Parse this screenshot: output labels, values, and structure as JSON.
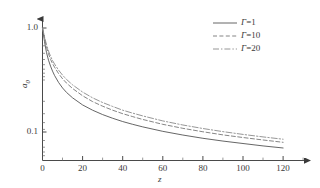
{
  "chart_data": {
    "type": "line",
    "title": "",
    "xlabel": "z",
    "ylabel": "a0",
    "ylabel_base": "a",
    "ylabel_sub": "0",
    "xlim": [
      0,
      125
    ],
    "ylim": [
      0.055,
      1.25
    ],
    "yscale": "log",
    "xscale": "linear",
    "grid": false,
    "legend_position": "top-right",
    "xticks": [
      0,
      20,
      40,
      60,
      80,
      100,
      120
    ],
    "xtick_labels": [
      "0",
      "20",
      "40",
      "60",
      "80",
      "100",
      "120"
    ],
    "yticks": [
      1.0,
      0.1
    ],
    "ytick_labels": [
      "1.0",
      "0.1"
    ],
    "x": [
      0,
      1,
      2,
      3,
      4,
      5,
      6,
      8,
      10,
      12,
      15,
      20,
      25,
      30,
      35,
      40,
      45,
      50,
      60,
      70,
      80,
      90,
      100,
      110,
      120
    ],
    "series": [
      {
        "name": "Γ=1",
        "label_symbol": "Γ",
        "label_value": "1",
        "style": "solid",
        "color": "#555555",
        "values": [
          1.0,
          0.74,
          0.58,
          0.49,
          0.43,
          0.385,
          0.35,
          0.3,
          0.265,
          0.24,
          0.213,
          0.182,
          0.162,
          0.147,
          0.1355,
          0.126,
          0.1185,
          0.112,
          0.1015,
          0.0935,
          0.087,
          0.0818,
          0.0775,
          0.0735,
          0.0702
        ]
      },
      {
        "name": "Γ=10",
        "label_symbol": "Γ",
        "label_value": "10",
        "style": "dashed",
        "color": "#777777",
        "values": [
          1.0,
          0.8,
          0.655,
          0.565,
          0.5,
          0.455,
          0.42,
          0.365,
          0.325,
          0.295,
          0.262,
          0.223,
          0.196,
          0.177,
          0.162,
          0.15,
          0.1405,
          0.132,
          0.1185,
          0.1085,
          0.1005,
          0.0938,
          0.0885,
          0.0838,
          0.0796
        ]
      },
      {
        "name": "Γ=20",
        "label_symbol": "Γ",
        "label_value": "20",
        "style": "dashdot",
        "color": "#8a8a8a",
        "values": [
          1.0,
          0.825,
          0.69,
          0.6,
          0.535,
          0.487,
          0.451,
          0.394,
          0.352,
          0.32,
          0.284,
          0.242,
          0.213,
          0.192,
          0.176,
          0.162,
          0.1518,
          0.1428,
          0.1278,
          0.1168,
          0.108,
          0.1008,
          0.0948,
          0.0897,
          0.0852
        ]
      }
    ]
  },
  "axes": {
    "x_arrow": true,
    "y_arrow": true,
    "tick_direction": "in"
  },
  "colors": {
    "axis": "#4a4a4a",
    "text": "#3a3a3a",
    "background": "#ffffff"
  }
}
